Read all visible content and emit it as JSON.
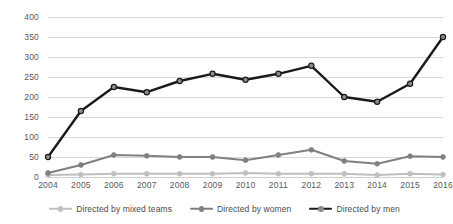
{
  "chart_data": {
    "type": "line",
    "title": "",
    "subtitle": "",
    "xlabel": "",
    "ylabel": "",
    "categories": [
      "2004",
      "2005",
      "2006",
      "2007",
      "2008",
      "2009",
      "2010",
      "2011",
      "2012",
      "2013",
      "2014",
      "2015",
      "2016"
    ],
    "x": [
      2004,
      2005,
      2006,
      2007,
      2008,
      2009,
      2010,
      2011,
      2012,
      2013,
      2014,
      2015,
      2016
    ],
    "ylim": [
      0,
      400
    ],
    "ytick_values": [
      0,
      50,
      100,
      150,
      200,
      250,
      300,
      350,
      400
    ],
    "ytick_labels": [
      "0",
      "50",
      "100",
      "150",
      "200",
      "250",
      "300",
      "350",
      "400"
    ],
    "grid": true,
    "legend_position": "bottom",
    "series": [
      {
        "name": "Directed by mixed teams",
        "color": "#bfbfbf",
        "marker": "circle",
        "values": [
          5,
          6,
          8,
          8,
          8,
          8,
          10,
          8,
          8,
          8,
          5,
          8,
          6
        ]
      },
      {
        "name": "Directed by women",
        "color": "#808080",
        "marker": "circle",
        "values": [
          10,
          30,
          55,
          53,
          50,
          50,
          42,
          55,
          68,
          40,
          33,
          52,
          50
        ]
      },
      {
        "name": "Directed by men",
        "color": "#1a1a1a",
        "marker": "circle",
        "values": [
          50,
          165,
          225,
          212,
          240,
          258,
          243,
          258,
          278,
          200,
          188,
          233,
          350
        ]
      }
    ]
  },
  "legend": {
    "items": [
      {
        "label": "Directed by mixed teams"
      },
      {
        "label": "Directed by women"
      },
      {
        "label": "Directed by men"
      }
    ]
  }
}
